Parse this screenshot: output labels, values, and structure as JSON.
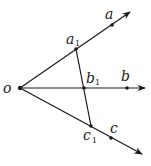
{
  "diagram": {
    "stroke_color": "#1a1a1a",
    "origin": {
      "label": "o",
      "x": 20,
      "y": 88
    },
    "rays": [
      {
        "name": "ray-oa",
        "end": {
          "x": 130,
          "y": 12
        }
      },
      {
        "name": "ray-ob",
        "end": {
          "x": 145,
          "y": 88
        }
      },
      {
        "name": "ray-oc",
        "end": {
          "x": 142,
          "y": 154
        }
      }
    ],
    "points": {
      "a": {
        "label": "a",
        "sub": "",
        "x": 112,
        "y": 25
      },
      "b": {
        "label": "b",
        "sub": "",
        "x": 127,
        "y": 88
      },
      "c": {
        "label": "c",
        "sub": "",
        "x": 111,
        "y": 138
      },
      "a1": {
        "label": "a",
        "sub": "1",
        "x": 76,
        "y": 49
      },
      "b1": {
        "label": "b",
        "sub": "1",
        "x": 84,
        "y": 88
      },
      "c1": {
        "label": "c",
        "sub": "1",
        "x": 91,
        "y": 126
      }
    }
  }
}
